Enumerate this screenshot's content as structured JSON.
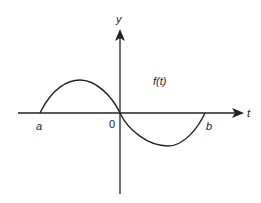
{
  "diagram": {
    "title": "",
    "axes": {
      "x_label": "t",
      "y_label": "y",
      "origin_label": "0"
    },
    "curve": {
      "label": "f(t)",
      "description": "one period of a sine-like wave from a to b, positive lobe on [a,0], negative lobe on [0,b]"
    },
    "points": {
      "a_label": "a",
      "b_label": "b"
    },
    "colors": {
      "stroke": "#222222",
      "background": "#ffffff"
    }
  }
}
